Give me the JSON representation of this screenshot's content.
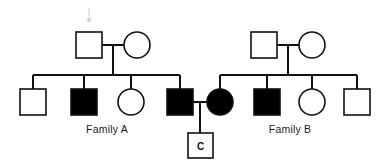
{
  "figure": {
    "type": "pedigree-chart",
    "width": 386,
    "height": 165,
    "background_color": "#ffffff",
    "line_color": "#111111",
    "affected_fill": "#000000",
    "unaffected_fill": "#ffffff"
  },
  "labels": {
    "family_a": "Family A",
    "family_b": "Family B",
    "proband_child": "C"
  },
  "legend_semantics": {
    "square": "male",
    "circle": "female",
    "filled": "affected",
    "open": "unaffected"
  },
  "generations": {
    "gen1": {
      "name": "parents",
      "members": [
        {
          "id": "A-I-1",
          "shape": "square",
          "sex": "male",
          "status": "unaffected",
          "family": "Family A",
          "cx": 89,
          "cy": 45
        },
        {
          "id": "A-I-2",
          "shape": "circle",
          "sex": "female",
          "status": "unaffected",
          "family": "Family A",
          "cx": 137,
          "cy": 45
        },
        {
          "id": "B-I-1",
          "shape": "square",
          "sex": "male",
          "status": "unaffected",
          "family": "Family B",
          "cx": 264,
          "cy": 45
        },
        {
          "id": "B-I-2",
          "shape": "circle",
          "sex": "female",
          "status": "unaffected",
          "family": "Family B",
          "cx": 312,
          "cy": 45
        }
      ]
    },
    "gen2": {
      "name": "children",
      "members": [
        {
          "id": "A-II-1",
          "shape": "square",
          "sex": "male",
          "status": "unaffected",
          "family": "Family A",
          "cx": 33,
          "cy": 102
        },
        {
          "id": "A-II-2",
          "shape": "square",
          "sex": "male",
          "status": "affected",
          "family": "Family A",
          "cx": 84,
          "cy": 102
        },
        {
          "id": "A-II-3",
          "shape": "circle",
          "sex": "female",
          "status": "unaffected",
          "family": "Family A",
          "cx": 131,
          "cy": 102
        },
        {
          "id": "A-II-4",
          "shape": "square",
          "sex": "male",
          "status": "affected",
          "family": "Family A",
          "cx": 180,
          "cy": 102
        },
        {
          "id": "B-II-1",
          "shape": "circle",
          "sex": "female",
          "status": "affected",
          "family": "Family B",
          "cx": 220,
          "cy": 102
        },
        {
          "id": "B-II-2",
          "shape": "square",
          "sex": "male",
          "status": "affected",
          "family": "Family B",
          "cx": 267,
          "cy": 102
        },
        {
          "id": "B-II-3",
          "shape": "circle",
          "sex": "female",
          "status": "unaffected",
          "family": "Family B",
          "cx": 312,
          "cy": 102
        },
        {
          "id": "B-II-4",
          "shape": "square",
          "sex": "male",
          "status": "unaffected",
          "family": "Family B",
          "cx": 357,
          "cy": 102
        }
      ]
    },
    "gen3": {
      "name": "grandchild",
      "members": [
        {
          "id": "C-III-1",
          "shape": "square",
          "sex": "male",
          "status": "unaffected",
          "family": "cross",
          "label": "C",
          "cx": 200,
          "cy": 146
        }
      ]
    }
  },
  "matings": [
    {
      "id": "mating-a",
      "partners": [
        "A-I-1",
        "A-I-2"
      ],
      "offspring": [
        "A-II-1",
        "A-II-2",
        "A-II-3",
        "A-II-4"
      ]
    },
    {
      "id": "mating-b",
      "partners": [
        "B-I-1",
        "B-I-2"
      ],
      "offspring": [
        "B-II-1",
        "B-II-2",
        "B-II-3",
        "B-II-4"
      ]
    },
    {
      "id": "mating-c",
      "partners": [
        "A-II-4",
        "B-II-1"
      ],
      "offspring": [
        "C-III-1"
      ]
    }
  ]
}
